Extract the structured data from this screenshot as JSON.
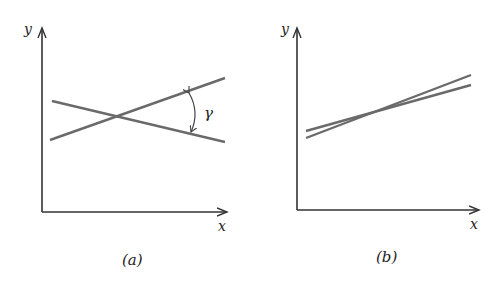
{
  "figure": {
    "panels": [
      {
        "id": "a",
        "caption": "(a)",
        "x_label": "x",
        "y_label": "y",
        "angle_label": "γ",
        "description": "Two lines crossing at a large angle γ"
      },
      {
        "id": "b",
        "caption": "(b)",
        "x_label": "x",
        "y_label": "y",
        "description": "Two nearly parallel lines crossing at a small angle"
      }
    ],
    "colors": {
      "axis": "#333333",
      "line": "#6a6a6a",
      "text": "#222222",
      "background": "#ffffff"
    }
  }
}
